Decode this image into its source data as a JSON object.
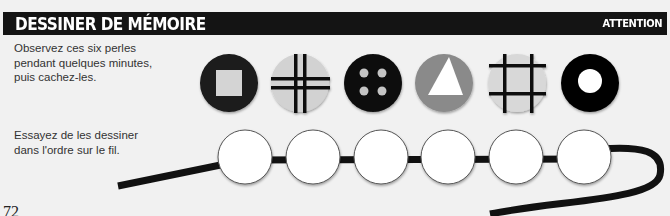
{
  "header": {
    "title": "DESSINER DE MÉMOIRE",
    "tag": "ATTENTION",
    "background": "#141414",
    "text_color": "#ffffff"
  },
  "instructions": {
    "observe": [
      "Observez ces six perles",
      "pendant quelques minutes,",
      "puis cachez-les."
    ],
    "draw": [
      "Essayez de les dessiner",
      "dans l'ordre sur le fil."
    ]
  },
  "model_beads": [
    {
      "name": "bead-square",
      "background": "#1a1a1a",
      "pattern": "light-grey square"
    },
    {
      "name": "bead-double-cross",
      "background": "#d2d2d2",
      "pattern": "black double-line cross"
    },
    {
      "name": "bead-four-dots",
      "background": "#080808",
      "pattern": "four grey dots"
    },
    {
      "name": "bead-triangle",
      "background": "#8a8a8a",
      "pattern": "white triangle"
    },
    {
      "name": "bead-hash",
      "background": "#d8d8d8",
      "pattern": "black hash grid"
    },
    {
      "name": "bead-ring",
      "background": "#050505",
      "pattern": "white centre"
    }
  ],
  "answer_beads_count": 6,
  "page_number": "72"
}
